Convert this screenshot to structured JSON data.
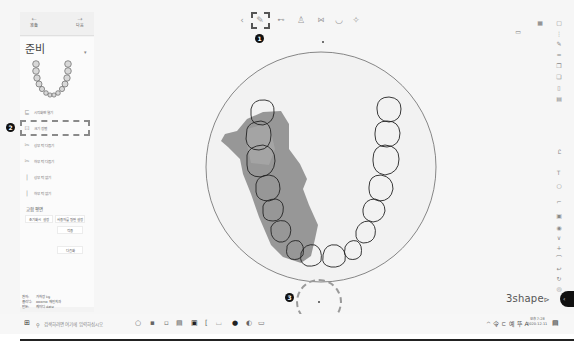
{
  "left_panel": {
    "tabs": [
      {
        "label": "准备",
        "icon": "back-icon"
      },
      {
        "label": "다음",
        "icon": "forward-icon"
      }
    ],
    "title": "준비",
    "menu_items": [
      {
        "label": "시작화면 열기",
        "icon": "scan-icon"
      },
      {
        "label": "크기 정렬",
        "icon": "align-icon"
      },
      {
        "label": "상부 턱 다듬기",
        "icon": "trim-upper-icon"
      },
      {
        "label": "하부 턱 다듬기",
        "icon": "trim-lower-icon"
      },
      {
        "label": "상부 턱 없기",
        "icon": "upper-jaw-icon"
      },
      {
        "label": "하부 턱 없기",
        "icon": "lower-jaw-icon"
      }
    ],
    "section_heading": "교합 평면",
    "buttons": {
      "reset": "초기화시 설정",
      "custom": "사용자를 평면 설정",
      "apply": "적용",
      "next": "다음화"
    },
    "meta": [
      {
        "key": "환자:",
        "value": "가차장 kg"
      },
      {
        "key": "클리닉:",
        "value": "ooomo 재인치과"
      },
      {
        "key": "만든:",
        "value": "케이디 date"
      }
    ]
  },
  "callouts": [
    "1",
    "2",
    "3"
  ],
  "toolbar": {
    "items": [
      "back-icon",
      "scan-tool-icon",
      "bite-icon",
      "upper-icon",
      "lower-icon",
      "rotate-icon",
      "settings-icon"
    ]
  },
  "right_toolbar": {
    "top_icons": [
      "grid-icon",
      "dots-icon",
      "pen-icon",
      "ruler-icon",
      "copy-icon",
      "paste-icon",
      "file-icon",
      "file2-icon"
    ],
    "mid_icons": [
      "measure-icon",
      "text-icon",
      "circle-icon",
      "crop-icon",
      "palette-icon"
    ],
    "bottom_icons": [
      "layers-icon",
      "chevron-down-icon",
      "plus-icon",
      "undo-icon",
      "redo-icon",
      "refresh-icon",
      "lock-icon"
    ]
  },
  "logo": "3shape",
  "taskbar": {
    "search_placeholder": "검색하려면 여기에 입력하십시오",
    "tray": "^ 令 ㄷ 예 뚜 A",
    "time": "오후 7:28",
    "date": "2020-12-11"
  }
}
